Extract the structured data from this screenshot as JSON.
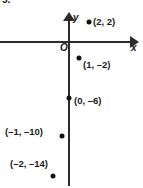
{
  "problem": {
    "number": "5."
  },
  "axes": {
    "x_label": "x",
    "y_label": "y",
    "origin_label": "O"
  },
  "chart_data": {
    "type": "scatter",
    "title": "",
    "xlabel": "x",
    "ylabel": "y",
    "grid": false,
    "legend": null,
    "xlim": [
      -3,
      3
    ],
    "ylim": [
      -16,
      4
    ],
    "x": [
      2,
      1,
      0,
      -1,
      -2
    ],
    "y": [
      2,
      -2,
      -6,
      -10,
      -14
    ],
    "point_labels": [
      "(2, 2)",
      "(1, –2)",
      "(0, –6)",
      "(–1, –10)",
      "(–2, –14)"
    ],
    "points": [
      {
        "label": "(2, 2)",
        "x": 2,
        "y": 2,
        "px": 89,
        "py": 22,
        "label_px": 93,
        "label_py": 16,
        "label_align": "right"
      },
      {
        "label": "(1, –2)",
        "x": 1,
        "y": -2,
        "px": 79,
        "py": 58,
        "label_px": 83,
        "label_py": 59,
        "label_align": "right"
      },
      {
        "label": "(0, –6)",
        "x": 0,
        "y": -6,
        "px": 69,
        "py": 98,
        "label_px": 74,
        "label_py": 95,
        "label_align": "right"
      },
      {
        "label": "(–1, –10)",
        "x": -1,
        "y": -10,
        "px": 62,
        "py": 136,
        "label_px": 5,
        "label_py": 126,
        "label_align": "left"
      },
      {
        "label": "(–2, –14)",
        "x": -2,
        "y": -14,
        "px": 53,
        "py": 176,
        "label_px": 10,
        "label_py": 158,
        "label_align": "left"
      }
    ]
  }
}
